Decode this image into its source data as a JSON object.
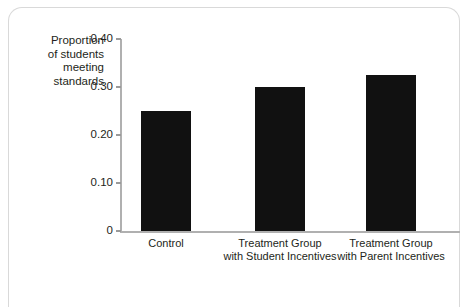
{
  "chart_data": {
    "type": "bar",
    "title": "",
    "xlabel": "",
    "ylabel": "Proportion of students meeting standards",
    "ylabel_lines": [
      "Proportion",
      "of students",
      "meeting",
      "standards"
    ],
    "categories": [
      "Control",
      "Treatment Group with Student Incentives",
      "Treatment Group with Parent Incentives"
    ],
    "category_lines": [
      [
        "Control"
      ],
      [
        "Treatment Group",
        "with Student Incentives"
      ],
      [
        "Treatment Group",
        "with Parent Incentives"
      ]
    ],
    "values": [
      0.25,
      0.3,
      0.325
    ],
    "ylim": [
      0,
      0.4
    ],
    "yticks": [
      0,
      0.1,
      0.2,
      0.3,
      0.4
    ],
    "ytick_labels": [
      "0",
      "0.10",
      "0.20",
      "0.30",
      "0.40"
    ],
    "grid": false,
    "legend": null,
    "bar_color": "#111111",
    "axis_color": "#b0b0b0",
    "text_color": "#231f20"
  }
}
